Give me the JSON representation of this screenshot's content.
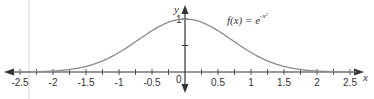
{
  "chart_data": {
    "type": "line",
    "title": "",
    "annotation": "f(x) = e^(-x^2)",
    "function_label": {
      "main": "f(x) = e",
      "exponent": "-x",
      "exponent_power": "2"
    },
    "xlabel": "x",
    "ylabel": "y",
    "xlim": [
      -2.5,
      2.5
    ],
    "ylim": [
      0,
      1
    ],
    "x_ticks": [
      "-2.5",
      "-2",
      "-1.5",
      "-1",
      "-0.5",
      "0",
      "0.5",
      "1",
      "1.5",
      "2",
      "2.5"
    ],
    "y_ticks": [
      "1"
    ],
    "grid": false,
    "legend": null,
    "series": [
      {
        "name": "f(x) = e^(-x^2)",
        "x": [
          -2.5,
          -2.25,
          -2,
          -1.75,
          -1.5,
          -1.25,
          -1,
          -0.75,
          -0.5,
          -0.25,
          0,
          0.25,
          0.5,
          0.75,
          1,
          1.25,
          1.5,
          1.75,
          2,
          2.25,
          2.5
        ],
        "values": [
          0.0019,
          0.0063,
          0.0183,
          0.0468,
          0.1054,
          0.2096,
          0.3679,
          0.5698,
          0.7788,
          0.9394,
          1.0,
          0.9394,
          0.7788,
          0.5698,
          0.3679,
          0.2096,
          0.1054,
          0.0468,
          0.0183,
          0.0063,
          0.0019
        ]
      }
    ],
    "colors": {
      "curve": "#8a8a8a",
      "axis": "#333333",
      "guide_line": "#d0d0d0"
    }
  }
}
